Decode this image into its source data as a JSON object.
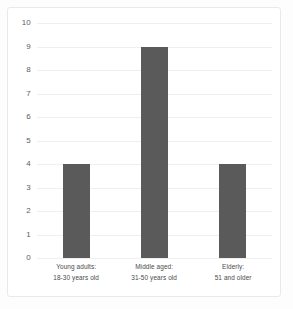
{
  "chart_data": {
    "type": "bar",
    "title": "",
    "xlabel": "",
    "ylabel": "",
    "categories": [
      "Young adults: 18-30 years old",
      "Middle aged: 31-50 years old",
      "Elderly: 51 and older"
    ],
    "category_lines": [
      [
        "Young adults:",
        "18-30 years old"
      ],
      [
        "Middle aged:",
        "31-50 years old"
      ],
      [
        "Elderly:",
        "51 and older"
      ]
    ],
    "values": [
      4,
      9,
      4
    ],
    "ylim": [
      0,
      10
    ],
    "ytick_labels": [
      "10",
      "9",
      "8",
      "7",
      "6",
      "5",
      "4",
      "3",
      "2",
      "1",
      "0"
    ],
    "ytick_values": [
      10,
      9,
      8,
      7,
      6,
      5,
      4,
      3,
      2,
      1,
      0
    ],
    "grid": true,
    "legend": "none",
    "bar_color": "#5a5a5a",
    "grid_color": "#efefef",
    "frame_color": "#e9e9e9",
    "background_color": "#ffffff"
  }
}
